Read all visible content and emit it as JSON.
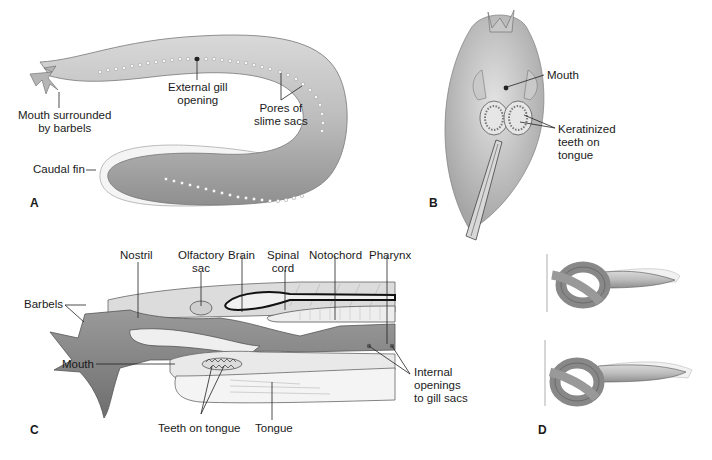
{
  "figure": {
    "panels": {
      "A": {
        "letter": "A",
        "labels": {
          "mouth_l1": "Mouth surrounded",
          "mouth_l2": "by barbels",
          "gill_l1": "External gill",
          "gill_l2": "opening",
          "pores_l1": "Pores of",
          "pores_l2": "slime sacs",
          "caudal": "Caudal fin"
        }
      },
      "B": {
        "letter": "B",
        "labels": {
          "mouth": "Mouth",
          "teeth_l1": "Keratinized",
          "teeth_l2": "teeth on",
          "teeth_l3": "tongue"
        }
      },
      "C": {
        "letter": "C",
        "labels": {
          "nostril": "Nostril",
          "olfactory_l1": "Olfactory",
          "olfactory_l2": "sac",
          "brain": "Brain",
          "spinal_l1": "Spinal",
          "spinal_l2": "cord",
          "notochord": "Notochord",
          "pharynx": "Pharynx",
          "barbels": "Barbels",
          "mouth": "Mouth",
          "teeth": "Teeth on tongue",
          "tongue": "Tongue",
          "internal_l1": "Internal",
          "internal_l2": "openings",
          "internal_l3": "to gill sacs"
        }
      },
      "D": {
        "letter": "D"
      }
    },
    "colors": {
      "body_fill": "#bdbdbd",
      "body_dark": "#8a8a8a",
      "fin_fill": "#f2f2f2",
      "line": "#333333",
      "pore": "#f5f5f5"
    }
  }
}
